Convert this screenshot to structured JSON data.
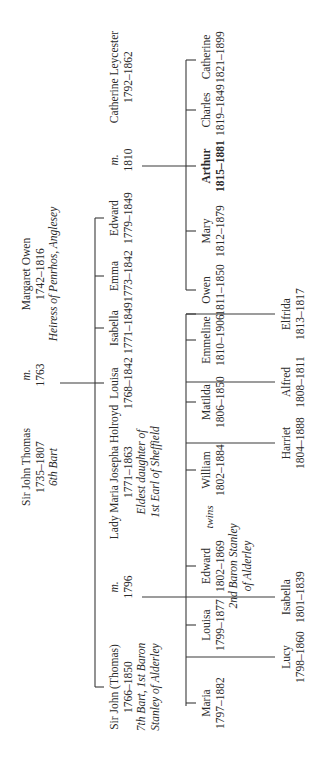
{
  "diagram": {
    "type": "family-tree",
    "orientation": "rotated-90-counterclockwise",
    "line_color": "#3a3a3a",
    "text_color": "#2a2a2a"
  },
  "generation0": {
    "husband": {
      "name": "Sir John Thomas",
      "dates": "1735–1807",
      "note": "6th Bart"
    },
    "marriage": {
      "label": "m.",
      "year": "1763"
    },
    "wife": {
      "name": "Margaret Owen",
      "dates": "1742–1816",
      "note": "Heiress of Penrhos, Anglesey"
    }
  },
  "generation1": {
    "children": [
      {
        "name": "Sir John (Thomas)",
        "dates": "1766–1850",
        "note1": "7th Bart, 1st Baron",
        "note2": "Stanley of Alderley"
      },
      {
        "name": "Louisa",
        "dates": "1768–1842"
      },
      {
        "name": "Isabella",
        "dates": "1771–1849"
      },
      {
        "name": "Emma",
        "dates": "1773–1842"
      },
      {
        "name": "Edward",
        "dates": "1779–1849"
      }
    ],
    "marriage_john": {
      "label": "m.",
      "year": "1796"
    },
    "spouse_john": {
      "name": "Lady Maria Josepha Holroyd",
      "dates": "1771–1863",
      "note1": "Eldest daughter of",
      "note2": "1st Earl of Sheffield"
    },
    "marriage_edward": {
      "label": "m.",
      "year": "1810"
    },
    "spouse_edward": {
      "name": "Catherine Leycester",
      "dates": "1792–1862"
    }
  },
  "generation2_john": {
    "row1": [
      {
        "name": "Maria",
        "dates": "1797–1882"
      },
      {
        "name": "Louisa",
        "dates": "1799–1877"
      },
      {
        "name": "Edward",
        "dates": "1802–1869",
        "note1": "2nd Baron Stanley",
        "note2": "of Alderley"
      },
      {
        "name": "William",
        "dates": "1802–1884"
      },
      {
        "name": "Matilda",
        "dates": "1806–1850"
      },
      {
        "name": "Emmeline",
        "dates": "1810–1906"
      }
    ],
    "twins_label": "twins",
    "row2": [
      {
        "name": "Lucy",
        "dates": "1798–1860"
      },
      {
        "name": "Isabella",
        "dates": "1801–1839"
      },
      {
        "name": "Harriet",
        "dates": "1804–1888"
      },
      {
        "name": "Alfred",
        "dates": "1808–1811"
      },
      {
        "name": "Elfrida",
        "dates": "1813–1817"
      }
    ]
  },
  "generation2_edward": {
    "children": [
      {
        "name": "Owen",
        "dates": "1811–1850"
      },
      {
        "name": "Mary",
        "dates": "1812–1879"
      },
      {
        "name": "Arthur",
        "dates": "1815–1881",
        "emphasis": "bold"
      },
      {
        "name": "Charles",
        "dates": "1819–1849"
      },
      {
        "name": "Catherine",
        "dates": "1821–1899"
      }
    ]
  }
}
